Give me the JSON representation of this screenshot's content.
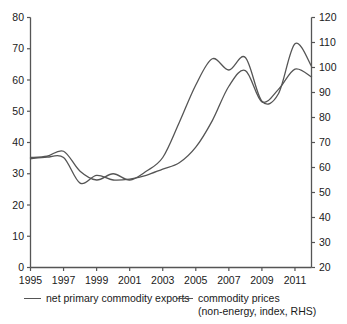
{
  "chart_data": {
    "type": "line",
    "title": "",
    "subtitle": "",
    "xlabel": "",
    "ylabel": "",
    "grid": false,
    "legend_position": "bottom",
    "x": [
      1995,
      1996,
      1997,
      1998,
      1999,
      2000,
      2001,
      2002,
      2003,
      2004,
      2005,
      2006,
      2007,
      2008,
      2009,
      2010,
      2011,
      2012
    ],
    "x_tick_labels": [
      "1995",
      "1997",
      "1999",
      "2001",
      "2003",
      "2005",
      "2007",
      "2009",
      "2011"
    ],
    "x_tick_values": [
      1995,
      1997,
      1999,
      2001,
      2003,
      2005,
      2007,
      2009,
      2011
    ],
    "xlim": [
      1995,
      2012
    ],
    "axes": {
      "left": {
        "label": "",
        "ylim": [
          0,
          80
        ],
        "ticks": [
          0,
          10,
          20,
          30,
          40,
          50,
          60,
          70,
          80
        ],
        "tick_labels": [
          "0",
          "10",
          "20",
          "30",
          "40",
          "50",
          "60",
          "70",
          "80"
        ]
      },
      "right": {
        "label": "RHS",
        "ylim": [
          20,
          120
        ],
        "ticks": [
          20,
          30,
          40,
          50,
          60,
          70,
          80,
          90,
          100,
          110,
          120
        ],
        "tick_labels": [
          "20",
          "30",
          "40",
          "50",
          "60",
          "70",
          "80",
          "90",
          "100",
          "110",
          "120"
        ]
      }
    },
    "series": [
      {
        "name": "net primary commodity exports",
        "legend_label": "net primary commodity exports",
        "axis": "left",
        "color": "#555555",
        "values": [
          34.8,
          35.3,
          35.2,
          27.0,
          29.5,
          28.0,
          28.3,
          29.5,
          31.5,
          33.5,
          38.5,
          47.0,
          58.0,
          63.0,
          53.0,
          57.0,
          63.5,
          61.0
        ]
      },
      {
        "name": "commodity prices (non-energy, index, RHS)",
        "legend_label": "commodity prices",
        "legend_sublabel": "(non-energy, index, RHS)",
        "axis": "right",
        "color": "#555555",
        "values": [
          64.0,
          64.5,
          66.5,
          58.5,
          55.0,
          57.5,
          55.0,
          58.5,
          64.0,
          78.0,
          93.0,
          103.5,
          99.0,
          104.0,
          86.5,
          89.5,
          109.5,
          100.5
        ]
      }
    ],
    "annotations": []
  },
  "legend": {
    "exports_label": "net primary commodity exports",
    "prices_label": "commodity prices",
    "prices_sublabel": "(non-energy, index, RHS)"
  },
  "colors": {
    "line": "#555555",
    "axis": "#555555",
    "text": "#1a1a1a",
    "background": "#ffffff"
  }
}
